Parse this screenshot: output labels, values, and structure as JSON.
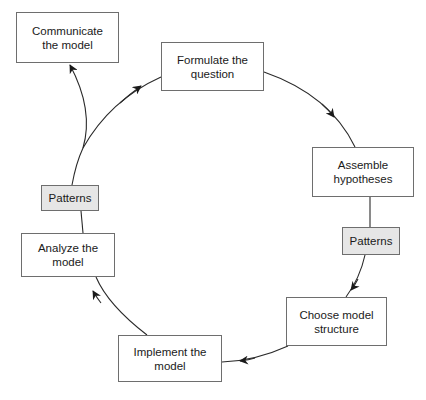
{
  "diagram": {
    "type": "cycle",
    "nodes": [
      {
        "id": "communicate",
        "label": "Communicate\nthe model",
        "x": 16,
        "y": 12,
        "w": 103,
        "h": 51,
        "style": "process"
      },
      {
        "id": "formulate",
        "label": "Formulate the\nquestion",
        "x": 161,
        "y": 42,
        "w": 103,
        "h": 49,
        "style": "process"
      },
      {
        "id": "assemble",
        "label": "Assemble\nhypotheses",
        "x": 312,
        "y": 147,
        "w": 102,
        "h": 50,
        "style": "process"
      },
      {
        "id": "patterns_right",
        "label": "Patterns",
        "x": 342,
        "y": 227,
        "w": 58,
        "h": 28,
        "style": "pattern"
      },
      {
        "id": "choose",
        "label": "Choose model\nstructure",
        "x": 286,
        "y": 297,
        "w": 101,
        "h": 49,
        "style": "process"
      },
      {
        "id": "implement",
        "label": "Implement the\nmodel",
        "x": 118,
        "y": 335,
        "w": 104,
        "h": 47,
        "style": "process"
      },
      {
        "id": "analyze",
        "label": "Analyze the\nmodel",
        "x": 21,
        "y": 233,
        "w": 94,
        "h": 44,
        "style": "process"
      },
      {
        "id": "patterns_left",
        "label": "Patterns",
        "x": 41,
        "y": 185,
        "w": 58,
        "h": 26,
        "style": "pattern"
      }
    ],
    "edges": [
      {
        "from": "patterns_left",
        "to": "communicate",
        "arrow": true
      },
      {
        "from": "patterns_left",
        "to": "formulate",
        "arrow": true
      },
      {
        "from": "formulate",
        "to": "assemble",
        "arrow": true
      },
      {
        "from": "assemble",
        "to": "patterns_right",
        "arrow": false
      },
      {
        "from": "patterns_right",
        "to": "choose",
        "arrow": true
      },
      {
        "from": "choose",
        "to": "implement",
        "arrow": true
      },
      {
        "from": "implement",
        "to": "analyze",
        "arrow": true
      },
      {
        "from": "analyze",
        "to": "patterns_left",
        "arrow": false
      }
    ],
    "colors": {
      "stroke": "#2a2a2a",
      "box_border": "#6e6e6e",
      "pattern_fill": "#e6e6e6",
      "box_fill": "#ffffff"
    }
  }
}
